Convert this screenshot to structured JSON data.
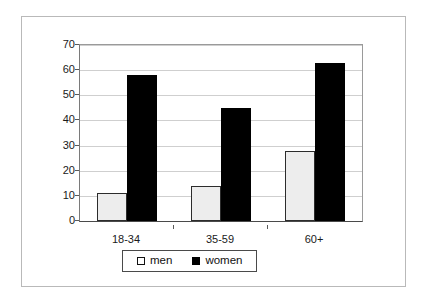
{
  "chart_data": {
    "type": "bar",
    "title": "",
    "subtitle": "",
    "xlabel": "",
    "ylabel": "",
    "categories": [
      "18-34",
      "35-59",
      "60+"
    ],
    "series": [
      {
        "name": "men",
        "values": [
          11,
          14,
          28
        ],
        "color": "#ededed",
        "edge_color": "#2c2c2c"
      },
      {
        "name": "women",
        "values": [
          58,
          45,
          63
        ],
        "color": "#000000",
        "edge_color": "#000000"
      }
    ],
    "ylim": [
      0,
      70
    ],
    "yticks": [
      0,
      10,
      20,
      30,
      40,
      50,
      60,
      70
    ],
    "ytick_labels": [
      "0",
      "10",
      "20",
      "30",
      "40",
      "50",
      "60",
      "70"
    ],
    "grid": true,
    "grid_axis": "y",
    "legend": {
      "position": "bottom-center",
      "entries": [
        {
          "label": "men",
          "swatch": "open-square-swatch"
        },
        {
          "label": "women",
          "swatch": "filled-square-swatch"
        }
      ]
    },
    "background": "#ffffff",
    "frame_color": "#b9b9b9"
  }
}
